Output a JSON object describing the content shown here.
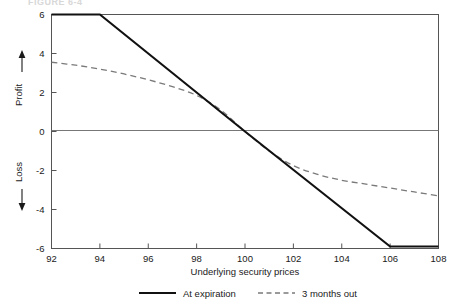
{
  "figure": {
    "caption_faint": "FIGURE 6-4"
  },
  "chart_data": {
    "type": "line",
    "title": "",
    "xlabel": "Underlying security prices",
    "ylabel": "← Loss    Profit →",
    "ylabel_parts": {
      "loss": "Loss",
      "profit": "Profit"
    },
    "xlim": [
      92,
      108
    ],
    "ylim": [
      -6,
      6
    ],
    "xticks": [
      92,
      94,
      96,
      98,
      100,
      102,
      104,
      106,
      108
    ],
    "yticks": [
      6,
      4,
      2,
      0,
      -2,
      -4,
      -6
    ],
    "xtick_labels": [
      "92",
      "94",
      "96",
      "98",
      "100",
      "102",
      "104",
      "106",
      "108"
    ],
    "ytick_labels": [
      "6",
      "4",
      "2",
      "0",
      "-2",
      "-4",
      "-6"
    ],
    "grid": false,
    "zero_line": true,
    "legend_position": "below",
    "series": [
      {
        "name": "At expiration",
        "style": "solid",
        "color": "#111111",
        "x": [
          92,
          94,
          100,
          106,
          108
        ],
        "values": [
          6.0,
          6.0,
          0.0,
          -5.9,
          -5.9
        ]
      },
      {
        "name": "3 months out",
        "style": "dashed",
        "color": "#7a7a7a",
        "x": [
          92,
          93,
          94,
          95,
          96,
          97,
          98,
          99,
          100,
          101,
          102,
          103,
          104,
          105,
          106,
          107,
          108
        ],
        "values": [
          3.55,
          3.4,
          3.2,
          2.95,
          2.65,
          2.3,
          1.85,
          1.1,
          0.0,
          -1.0,
          -1.75,
          -2.2,
          -2.5,
          -2.7,
          -2.9,
          -3.1,
          -3.3
        ]
      }
    ]
  },
  "legend": {
    "items": [
      {
        "label": "At expiration",
        "style": "solid"
      },
      {
        "label": "3 months out",
        "style": "dashed"
      }
    ]
  }
}
